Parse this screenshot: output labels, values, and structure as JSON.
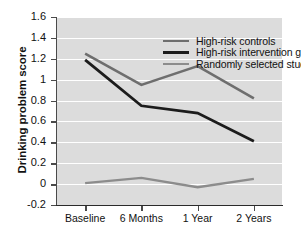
{
  "chart_data": {
    "type": "line",
    "title": "",
    "xlabel": "",
    "ylabel": "Drinking problem score",
    "categories": [
      "Baseline",
      "6 Months",
      "1 Year",
      "2 Years"
    ],
    "ylim": [
      -0.2,
      1.6
    ],
    "yticks": [
      -0.2,
      0,
      0.2,
      0.4,
      0.6,
      0.8,
      1.0,
      1.2,
      1.4,
      1.6
    ],
    "ytick_labels": [
      "-0.2",
      "0",
      "0.2",
      "0.4",
      "0.6",
      "0.8",
      "1",
      "1.2",
      "1.4",
      "1.6"
    ],
    "grid": true,
    "legend_position": "top-center",
    "series": [
      {
        "name": "High-risk controls",
        "color": "#6e6e6e",
        "width": 2.6,
        "values": [
          1.25,
          0.95,
          1.13,
          0.82
        ]
      },
      {
        "name": "High-risk intervention group",
        "color": "#1c1c1c",
        "width": 2.8,
        "values": [
          1.19,
          0.75,
          0.68,
          0.41
        ]
      },
      {
        "name": "Randomly selected students",
        "color": "#8c8c8c",
        "width": 2.4,
        "values": [
          0.01,
          0.06,
          -0.03,
          0.05
        ]
      }
    ]
  },
  "style": {
    "plot_background": "#dcdcdc",
    "gridline_color": "#ffffff",
    "axis_color": "#4a4a4a",
    "figure_background": "#ffffff"
  }
}
